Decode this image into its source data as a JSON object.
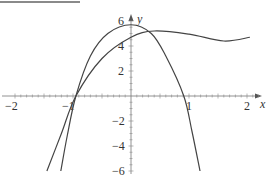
{
  "chart_data": {
    "type": "line",
    "title": "",
    "xlabel": "x",
    "ylabel": "y",
    "xlim": [
      -2.2,
      2.25
    ],
    "ylim": [
      -6.5,
      6.4
    ],
    "x_ticks": [
      "-2",
      "-1",
      "1",
      "2"
    ],
    "y_ticks": [
      "6",
      "4",
      "2",
      "-2",
      "-4",
      "-6"
    ],
    "grid": false,
    "series": [
      {
        "name": "curve-peaked",
        "points": [
          [
            -1.21,
            -6
          ],
          [
            -1.1,
            -3.2
          ],
          [
            -0.95,
            0
          ],
          [
            -0.7,
            3.2
          ],
          [
            -0.4,
            5.0
          ],
          [
            0,
            5.7
          ],
          [
            0.35,
            5.0
          ],
          [
            0.6,
            3.2
          ],
          [
            0.91,
            0
          ],
          [
            1.05,
            -2.8
          ],
          [
            1.19,
            -6
          ]
        ]
      },
      {
        "name": "curve-flat",
        "points": [
          [
            -1.45,
            -6
          ],
          [
            -1.2,
            -3.0
          ],
          [
            -0.95,
            0
          ],
          [
            -0.5,
            3.0
          ],
          [
            0,
            4.7
          ],
          [
            0.4,
            5.2
          ],
          [
            1.0,
            4.95
          ],
          [
            1.6,
            4.4
          ],
          [
            2.05,
            4.7
          ]
        ]
      }
    ]
  },
  "axes": {
    "x_label": "x",
    "y_label": "y",
    "x_tick_labels": [
      "−2",
      "−1",
      "1",
      "2"
    ],
    "y_tick_labels": [
      "6",
      "4",
      "2",
      "−2",
      "−4",
      "−6"
    ]
  },
  "colors": {
    "curve": "#444444",
    "axis": "#777777"
  }
}
